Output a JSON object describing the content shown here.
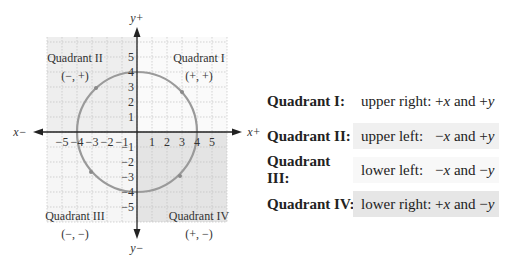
{
  "diagram": {
    "axis_labels": {
      "x_pos": "x+",
      "x_neg": "x−",
      "y_pos": "y+",
      "y_neg": "y−"
    },
    "x_ticks": [
      "−5",
      "−4",
      "−3",
      "−2",
      "−1",
      "1",
      "2",
      "3",
      "4",
      "5"
    ],
    "y_ticks": [
      "5",
      "4",
      "3",
      "2",
      "1",
      "−1",
      "−2",
      "−3",
      "−4",
      "−5"
    ],
    "circle": {
      "center": [
        0,
        0
      ],
      "radius": 4,
      "color": "#999999"
    },
    "quadrants": [
      {
        "name": "Quadrant I",
        "signs": "(+, +)",
        "fill": "#ffffff"
      },
      {
        "name": "Quadrant II",
        "signs": "(−, +)",
        "fill": "#eeeeee"
      },
      {
        "name": "Quadrant III",
        "signs": "(−, −)",
        "fill": "#f6f6f6"
      },
      {
        "name": "Quadrant IV",
        "signs": "(+, −)",
        "fill": "#e4e4e4"
      }
    ]
  },
  "table": [
    {
      "label": "Quadrant I:",
      "direction": "upper right:",
      "sx": "+",
      "x": "x",
      "and": " and ",
      "sy": "+",
      "y": "y",
      "box": "none"
    },
    {
      "label": "Quadrant II:",
      "direction": "upper left:",
      "sx": "−",
      "x": "x",
      "and": " and ",
      "sy": "+",
      "y": "y",
      "box": "#f0f0f0"
    },
    {
      "label": "Quadrant III:",
      "direction": "lower left:",
      "sx": "−",
      "x": "x",
      "and": " and ",
      "sy": "−",
      "y": "y",
      "box": "#f8f8f8"
    },
    {
      "label": "Quadrant IV:",
      "direction": "lower right:",
      "sx": "+",
      "x": "x",
      "and": " and ",
      "sy": "−",
      "y": "y",
      "box": "#e6e6e6"
    }
  ]
}
